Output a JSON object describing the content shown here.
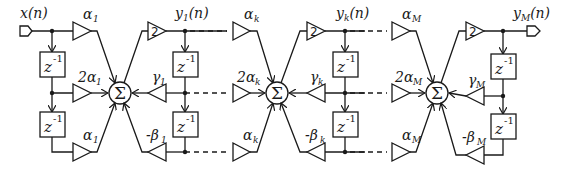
{
  "diagram": {
    "type": "signal-flow block diagram (cascaded biquad filter sections)",
    "input": {
      "label": "x(n)"
    },
    "sections": [
      {
        "id": "1",
        "output_label": "y",
        "output_sub": "1",
        "output_suffix": "(n)",
        "feedforward_gains": [
          {
            "label": "α",
            "prefix": "",
            "sub": "1"
          },
          {
            "label": "α",
            "prefix": "2",
            "sub": "1"
          },
          {
            "label": "α",
            "prefix": "",
            "sub": "1"
          }
        ],
        "feedback_gains": [
          {
            "label": "γ",
            "prefix": "",
            "sub": "1"
          },
          {
            "label": "β",
            "prefix": "-",
            "sub": "1"
          }
        ],
        "output_gain": "2"
      },
      {
        "id": "k",
        "output_label": "y",
        "output_sub": "k",
        "output_suffix": "(n)",
        "feedforward_gains": [
          {
            "label": "α",
            "prefix": "",
            "sub": "k"
          },
          {
            "label": "α",
            "prefix": "2",
            "sub": "k"
          },
          {
            "label": "α",
            "prefix": "",
            "sub": "k"
          }
        ],
        "feedback_gains": [
          {
            "label": "γ",
            "prefix": "",
            "sub": "k"
          },
          {
            "label": "β",
            "prefix": "-",
            "sub": "k"
          }
        ],
        "output_gain": "2"
      },
      {
        "id": "M",
        "output_label": "y",
        "output_sub": "M",
        "output_suffix": "(n)",
        "feedforward_gains": [
          {
            "label": "α",
            "prefix": "",
            "sub": "M"
          },
          {
            "label": "α",
            "prefix": "2",
            "sub": "M"
          },
          {
            "label": "α",
            "prefix": "",
            "sub": "M"
          }
        ],
        "feedback_gains": [
          {
            "label": "γ",
            "prefix": "",
            "sub": "M"
          },
          {
            "label": "β",
            "prefix": "-",
            "sub": "M"
          }
        ],
        "output_gain": "2"
      }
    ],
    "delay_label": "z",
    "delay_exponent": "-1",
    "sum_symbol": "Σ",
    "line_color": "#1a1a1a",
    "background": "#ffffff"
  }
}
